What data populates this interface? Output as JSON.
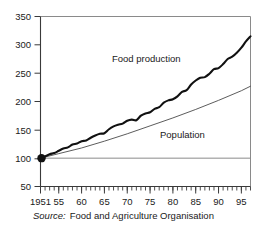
{
  "chart_data": {
    "type": "line",
    "title": "",
    "subtitle": "",
    "xlabel": "",
    "ylabel": "",
    "xlim": [
      1951,
      1997
    ],
    "ylim": [
      50,
      350
    ],
    "ytick_labels": [
      "50",
      "100",
      "150",
      "200",
      "250",
      "300",
      "350"
    ],
    "ytick_values": [
      50,
      100,
      150,
      200,
      250,
      300,
      350
    ],
    "xtick_labels": [
      "1951",
      "55",
      "60",
      "65",
      "70",
      "75",
      "80",
      "85",
      "90",
      "95"
    ],
    "xtick_values": [
      1951,
      1955,
      1960,
      1965,
      1970,
      1975,
      1980,
      1985,
      1990,
      1995
    ],
    "grid": false,
    "legend_position": "inline-annotations",
    "reference_line": {
      "y": 100,
      "color": "#8a8a8a"
    },
    "origin_marker": {
      "x": 1951,
      "y": 100,
      "color": "#111111"
    },
    "index_base": "1951 = 100",
    "series": [
      {
        "name": "Food production",
        "label": "Food production",
        "color": "#111111",
        "width": 2.1,
        "style": "wavy-thick",
        "x": [
          1951,
          1952,
          1953,
          1954,
          1955,
          1956,
          1957,
          1958,
          1959,
          1960,
          1961,
          1962,
          1963,
          1964,
          1965,
          1966,
          1967,
          1968,
          1969,
          1970,
          1971,
          1972,
          1973,
          1974,
          1975,
          1976,
          1977,
          1978,
          1979,
          1980,
          1981,
          1982,
          1983,
          1984,
          1985,
          1986,
          1987,
          1988,
          1989,
          1990,
          1991,
          1992,
          1993,
          1994,
          1995,
          1996,
          1997
        ],
        "values": [
          100,
          103,
          107,
          109,
          113,
          117,
          119,
          124,
          126,
          130,
          131,
          136,
          140,
          143,
          144,
          151,
          156,
          159,
          161,
          166,
          168,
          167,
          175,
          179,
          181,
          187,
          190,
          198,
          202,
          204,
          209,
          217,
          220,
          230,
          237,
          242,
          243,
          249,
          257,
          259,
          266,
          275,
          279,
          286,
          295,
          306,
          315
        ]
      },
      {
        "name": "Population",
        "label": "Population",
        "color": "#4a4a4a",
        "width": 0.9,
        "style": "smooth-thin",
        "x": [
          1951,
          1955,
          1960,
          1965,
          1970,
          1975,
          1980,
          1985,
          1990,
          1995,
          1997
        ],
        "values": [
          100,
          108,
          118,
          130,
          143,
          157,
          171,
          186,
          202,
          219,
          227
        ]
      }
    ]
  },
  "annotations": {
    "food_production": {
      "text": "Food production",
      "x": 112,
      "y": 62
    },
    "population": {
      "text": "Population",
      "x": 160,
      "y": 138
    }
  },
  "source": {
    "word": "Source:",
    "text": "Food and Agriculture Organisation"
  }
}
